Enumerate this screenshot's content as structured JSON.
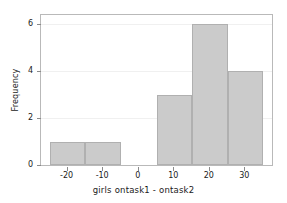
{
  "chart_data": {
    "type": "bar",
    "title": "",
    "xlabel": "girls ontask1 - ontask2",
    "ylabel": "Frequency",
    "xlim": [
      -27.5,
      37.5
    ],
    "ylim": [
      0,
      6.4
    ],
    "xticks": [
      -20,
      -10,
      0,
      10,
      20,
      30
    ],
    "xtick_labels": [
      "-20",
      "-10",
      "0",
      "10",
      "20",
      "30"
    ],
    "yticks": [
      0,
      2,
      4,
      6
    ],
    "ytick_labels": [
      "0",
      "2",
      "4",
      "6"
    ],
    "grid": "horizontal-faint",
    "legend": "none",
    "bin_width": 10,
    "bins": [
      {
        "label": "-25 to -15",
        "left": -25,
        "right": -15,
        "value": 1
      },
      {
        "label": "-15 to -5",
        "left": -15,
        "right": -5,
        "value": 1
      },
      {
        "label": "-5 to 5",
        "left": -5,
        "right": 5,
        "value": 0
      },
      {
        "label": "5 to 15",
        "left": 5,
        "right": 15,
        "value": 3
      },
      {
        "label": "15 to 25",
        "left": 15,
        "right": 25,
        "value": 6
      },
      {
        "label": "25 to 35",
        "left": 25,
        "right": 35,
        "value": 4
      }
    ],
    "categories": [
      "-25 to -15",
      "-15 to -5",
      "-5 to 5",
      "5 to 15",
      "15 to 25",
      "25 to 35"
    ],
    "values": [
      1,
      1,
      0,
      3,
      6,
      4
    ],
    "colors": {
      "bar_fill": "#cbcbcb",
      "bar_edge": "#b0b0b0",
      "frame": "#b9b9b9",
      "grid": "#f0f0f0",
      "text": "#1a1a1a",
      "background": "#ffffff"
    }
  }
}
